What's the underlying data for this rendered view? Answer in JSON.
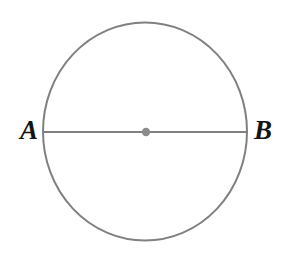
{
  "figure": {
    "kind": "geometry-diagram",
    "canvas": {
      "width": 287,
      "height": 260,
      "background_color": "#ffffff"
    },
    "style": {
      "stroke_color": "#808080",
      "stroke_width": 2,
      "center_dot_color": "#8c8c8c",
      "label_color": "#141414"
    },
    "circle": {
      "name": "circle",
      "center_x": 145,
      "center_y": 131.5,
      "radius_x": 102,
      "radius_y": 109,
      "fill": "none"
    },
    "diameter": {
      "name": "diameter-ab",
      "x1": 44,
      "y1": 132,
      "x2": 247,
      "y2": 132
    },
    "center_point": {
      "name": "center",
      "cx": 146,
      "cy": 132,
      "r": 4.2
    },
    "labels": {
      "a": "A",
      "b": "B"
    }
  }
}
